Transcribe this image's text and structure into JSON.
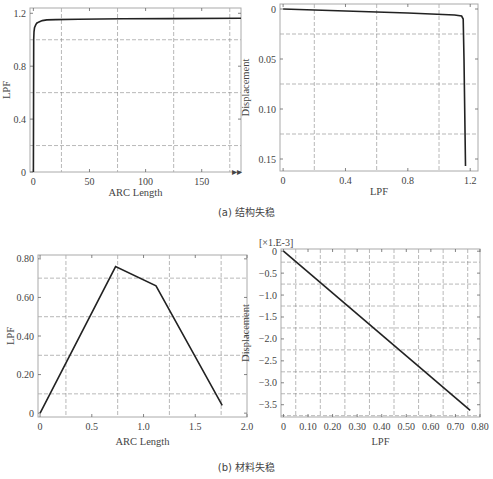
{
  "figure": {
    "caption_a": "(a) 结构失稳",
    "caption_b": "(b) 材料失稳"
  },
  "chart_data": [
    {
      "id": "a-left",
      "type": "line",
      "title": "",
      "xlabel": "ARC Length",
      "ylabel": "LPF",
      "xlim": [
        -3,
        185
      ],
      "ylim": [
        0,
        1.24
      ],
      "xticks": [
        0,
        50,
        100,
        150
      ],
      "yticks": [
        0,
        0.4,
        0.8,
        1.2
      ],
      "xtick_labels": [
        "0",
        "50",
        "100",
        "150"
      ],
      "ytick_labels": [
        "0",
        "0.4",
        "0.8",
        "1.2"
      ],
      "grid_x": [
        25,
        75,
        125,
        175
      ],
      "grid_y": [
        0.2,
        0.6,
        1.0
      ],
      "x": [
        0,
        0.3,
        0.6,
        1,
        2,
        3,
        5,
        8,
        12,
        20,
        40,
        80,
        120,
        185
      ],
      "y": [
        0,
        1.0,
        1.06,
        1.09,
        1.11,
        1.125,
        1.135,
        1.145,
        1.15,
        1.152,
        1.155,
        1.158,
        1.16,
        1.162
      ],
      "annotation": "▸▸"
    },
    {
      "id": "a-right",
      "type": "line",
      "title": "",
      "xlabel": "LPF",
      "ylabel": "Displacement",
      "xlim": [
        -0.02,
        1.25
      ],
      "ylim": [
        -0.005,
        0.162
      ],
      "y_inverted": true,
      "xticks": [
        0,
        0.4,
        0.8,
        1.2
      ],
      "yticks": [
        0,
        0.05,
        0.1,
        0.15
      ],
      "xtick_labels": [
        "0",
        "0.4",
        "0.8",
        "1.2"
      ],
      "ytick_labels": [
        "0",
        "0.05",
        "0.10",
        "0.15"
      ],
      "grid_x": [
        0.2,
        0.6,
        1.0
      ],
      "grid_y": [
        0.025,
        0.075,
        0.125
      ],
      "x": [
        0,
        0.4,
        0.8,
        1.1,
        1.145,
        1.155,
        1.16,
        1.17
      ],
      "y": [
        0,
        0.002,
        0.004,
        0.006,
        0.007,
        0.01,
        0.05,
        0.157
      ]
    },
    {
      "id": "b-left",
      "type": "line",
      "title": "",
      "xlabel": "ARC Length",
      "ylabel": "LPF",
      "xlim": [
        -0.02,
        2.0
      ],
      "ylim": [
        -0.02,
        0.82
      ],
      "xticks": [
        0,
        0.5,
        1.0,
        1.5,
        2.0
      ],
      "yticks": [
        0,
        0.2,
        0.4,
        0.6,
        0.8
      ],
      "xtick_labels": [
        "0",
        "0.5",
        "1.0",
        "1.5",
        "2.0"
      ],
      "ytick_labels": [
        "0",
        "0.20",
        "0.40",
        "0.60",
        "0.80"
      ],
      "grid_x": [
        0.25,
        0.75,
        1.25,
        1.75
      ],
      "grid_y": [
        0.1,
        0.3,
        0.5,
        0.7
      ],
      "x": [
        0,
        0.73,
        1.12,
        1.76
      ],
      "y": [
        0,
        0.76,
        0.66,
        0.04
      ]
    },
    {
      "id": "b-right",
      "type": "line",
      "title": "",
      "xlabel": "LPF",
      "ylabel": "Displacement",
      "y_multiplier_label": "[×1.E-3]",
      "xlim": [
        -0.01,
        0.8
      ],
      "ylim": [
        -3.78,
        0.05
      ],
      "xticks": [
        0,
        0.1,
        0.2,
        0.3,
        0.4,
        0.5,
        0.6,
        0.7,
        0.8
      ],
      "yticks": [
        0,
        -0.5,
        -1.0,
        -1.5,
        -2.0,
        -2.5,
        -3.0,
        -3.5
      ],
      "xtick_labels": [
        "0",
        "0.10",
        "0.20",
        "0.30",
        "0.40",
        "0.50",
        "0.60",
        "0.70",
        "0.80"
      ],
      "ytick_labels": [
        "0",
        "−0.5",
        "−1.0",
        "−1.5",
        "−2.0",
        "−2.5",
        "−3.0",
        "−3.5"
      ],
      "grid_x": [
        0.05,
        0.15,
        0.25,
        0.35,
        0.45,
        0.55,
        0.65,
        0.75
      ],
      "grid_y": [
        -0.25,
        -0.75,
        -1.25,
        -1.75,
        -2.25,
        -2.75,
        -3.25,
        -3.75
      ],
      "x": [
        0,
        0.76
      ],
      "y": [
        0,
        -3.63
      ]
    }
  ]
}
